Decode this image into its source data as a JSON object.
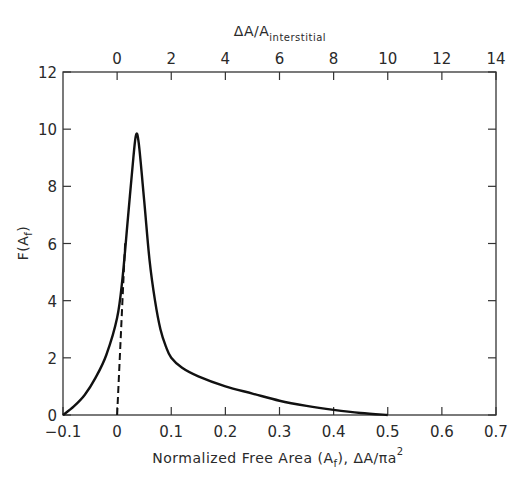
{
  "chart_data": {
    "type": "line",
    "title": "",
    "xlabel": "Normalized Free Area (A_f), ΔA/πa²",
    "xlabel_parts": {
      "main": "Normalized Free Area (A",
      "sub": "f",
      "rest": "), ΔA/πa",
      "sup": "2"
    },
    "ylabel": "F(A_f)",
    "ylabel_parts": {
      "main": "F(A",
      "sub": "f",
      "rest": ")"
    },
    "top_xlabel": "ΔA/A_interstitial",
    "top_xlabel_parts": {
      "main": "ΔA/A",
      "sub": "interstitial"
    },
    "xlim": [
      -0.1,
      0.7
    ],
    "ylim": [
      0,
      12
    ],
    "top_xlim": [
      -0.9,
      14
    ],
    "x_ticks": [
      "-0.1",
      "0",
      "0.1",
      "0.2",
      "0.3",
      "0.4",
      "0.5",
      "0.6",
      "0.7"
    ],
    "y_ticks": [
      "0",
      "2",
      "4",
      "6",
      "8",
      "10",
      "12"
    ],
    "top_x_ticks": [
      "0",
      "2",
      "4",
      "6",
      "8",
      "10",
      "12",
      "14"
    ],
    "grid": false,
    "legend": null,
    "series": [
      {
        "name": "F(A_f) solid",
        "style": "solid",
        "x": [
          -0.1,
          -0.08,
          -0.06,
          -0.04,
          -0.02,
          0.0,
          0.01,
          0.02,
          0.03,
          0.035,
          0.04,
          0.05,
          0.06,
          0.07,
          0.08,
          0.09,
          0.1,
          0.12,
          0.15,
          0.2,
          0.25,
          0.3,
          0.35,
          0.4,
          0.45,
          0.5
        ],
        "y": [
          0.0,
          0.3,
          0.7,
          1.3,
          2.1,
          3.4,
          4.8,
          6.9,
          9.0,
          9.8,
          9.5,
          7.5,
          5.4,
          4.0,
          3.0,
          2.4,
          2.0,
          1.65,
          1.35,
          1.0,
          0.75,
          0.5,
          0.32,
          0.18,
          0.07,
          0.0
        ]
      },
      {
        "name": "extrapolation dashed",
        "style": "dashed",
        "x": [
          0.0,
          0.015
        ],
        "y": [
          0.0,
          6.1
        ]
      }
    ]
  }
}
